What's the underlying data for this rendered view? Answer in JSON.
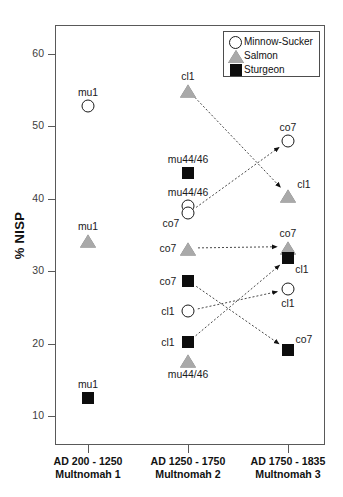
{
  "chart_data": {
    "type": "scatter",
    "title": "",
    "xlabel": "",
    "ylabel": "% NISP",
    "ylim": [
      6,
      64
    ],
    "yticks": [
      10,
      20,
      30,
      40,
      50,
      60
    ],
    "grid": false,
    "legend_position": "top-right",
    "categories": [
      {
        "line1": "AD 200 - 1250",
        "line2": "Multnomah 1"
      },
      {
        "line1": "AD 1250 - 1750",
        "line2": "Multnomah 2"
      },
      {
        "line1": "AD 1750 - 1835",
        "line2": "Multnomah 3"
      }
    ],
    "series": [
      {
        "name": "Minnow-Sucker",
        "marker": "circle",
        "color": "#ffffff",
        "edge": "#1a1a1a",
        "points": [
          {
            "category": 0,
            "value": 52.8,
            "label": "mu1",
            "label_pos": "above"
          },
          {
            "category": 1,
            "value": 39.0,
            "label": "mu44/46",
            "label_pos": "above"
          },
          {
            "category": 1,
            "value": 38.0,
            "label": "co7",
            "label_pos": "below-left"
          },
          {
            "category": 1,
            "value": 24.5,
            "label": "cl1",
            "label_pos": "left"
          },
          {
            "category": 2,
            "value": 48.0,
            "label": "co7",
            "label_pos": "above"
          },
          {
            "category": 2,
            "value": 27.5,
            "label": "cl1",
            "label_pos": "below"
          }
        ]
      },
      {
        "name": "Salmon",
        "marker": "triangle",
        "color": "#a9a9a9",
        "edge": "#6e6e6e",
        "points": [
          {
            "category": 0,
            "value": 34.3,
            "label": "mu1",
            "label_pos": "above"
          },
          {
            "category": 1,
            "value": 55.0,
            "label": "cl1",
            "label_pos": "above"
          },
          {
            "category": 1,
            "value": 33.2,
            "label": "co7",
            "label_pos": "left"
          },
          {
            "category": 1,
            "value": 17.8,
            "label": "mu44/46",
            "label_pos": "below"
          },
          {
            "category": 2,
            "value": 40.5,
            "label": "cl1",
            "label_pos": "above-right"
          },
          {
            "category": 2,
            "value": 33.4,
            "label": "co7",
            "label_pos": "above"
          }
        ]
      },
      {
        "name": "Sturgeon",
        "marker": "square",
        "color": "#0d0d0d",
        "edge": "#0d0d0d",
        "points": [
          {
            "category": 0,
            "value": 12.5,
            "label": "mu1",
            "label_pos": "above"
          },
          {
            "category": 1,
            "value": 43.5,
            "label": "mu44/46",
            "label_pos": "above"
          },
          {
            "category": 1,
            "value": 28.7,
            "label": "co7",
            "label_pos": "left"
          },
          {
            "category": 1,
            "value": 20.2,
            "label": "cl1",
            "label_pos": "left"
          },
          {
            "category": 2,
            "value": 31.8,
            "label": "cl1",
            "label_pos": "below-right"
          },
          {
            "category": 2,
            "value": 19.1,
            "label": "co7",
            "label_pos": "above-right"
          }
        ]
      }
    ],
    "connectors": [
      {
        "label": "cl1",
        "from": {
          "category": 1,
          "value": 55.0
        },
        "to": {
          "category": 2,
          "value": 40.5
        },
        "style": "dotted-arrow"
      },
      {
        "label": "co7",
        "from": {
          "category": 1,
          "value": 38.0
        },
        "to": {
          "category": 2,
          "value": 48.0
        },
        "style": "dotted-arrow"
      },
      {
        "label": "co7",
        "from": {
          "category": 1,
          "value": 33.2
        },
        "to": {
          "category": 2,
          "value": 33.4
        },
        "style": "dotted-arrow"
      },
      {
        "label": "co7",
        "from": {
          "category": 1,
          "value": 28.7
        },
        "to": {
          "category": 2,
          "value": 19.1
        },
        "style": "dotted-arrow"
      },
      {
        "label": "cl1",
        "from": {
          "category": 1,
          "value": 24.5
        },
        "to": {
          "category": 2,
          "value": 27.5
        },
        "style": "dotted-arrow"
      },
      {
        "label": "cl1",
        "from": {
          "category": 1,
          "value": 20.2
        },
        "to": {
          "category": 2,
          "value": 31.8
        },
        "style": "dotted-arrow"
      }
    ]
  },
  "legend": {
    "items": [
      {
        "label": "Minnow-Sucker",
        "marker": "circle"
      },
      {
        "label": "Salmon",
        "marker": "triangle"
      },
      {
        "label": "Sturgeon",
        "marker": "square"
      }
    ]
  },
  "axis": {
    "y_label": "% NISP",
    "y_tick_labels": [
      "60",
      "50",
      "40",
      "30",
      "20",
      "10"
    ]
  }
}
